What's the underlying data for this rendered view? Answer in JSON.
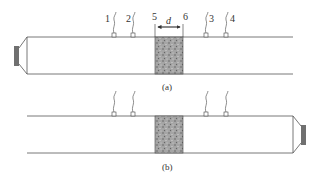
{
  "figure": {
    "panels": [
      {
        "id": "a",
        "caption": "(a)",
        "source_side": "left",
        "sensor_labels": [
          "1",
          "2",
          "3",
          "4"
        ],
        "sample_edge_labels": [
          "5",
          "6"
        ],
        "sample_thickness_label": "d"
      },
      {
        "id": "b",
        "caption": "(b)",
        "source_side": "right",
        "sensor_labels": [],
        "sample_edge_labels": [],
        "sample_thickness_label": ""
      }
    ],
    "colors": {
      "line": "#555555",
      "sample_fill": "#9a9a9a",
      "speaker_fill": "#707070",
      "text": "#333333"
    }
  }
}
